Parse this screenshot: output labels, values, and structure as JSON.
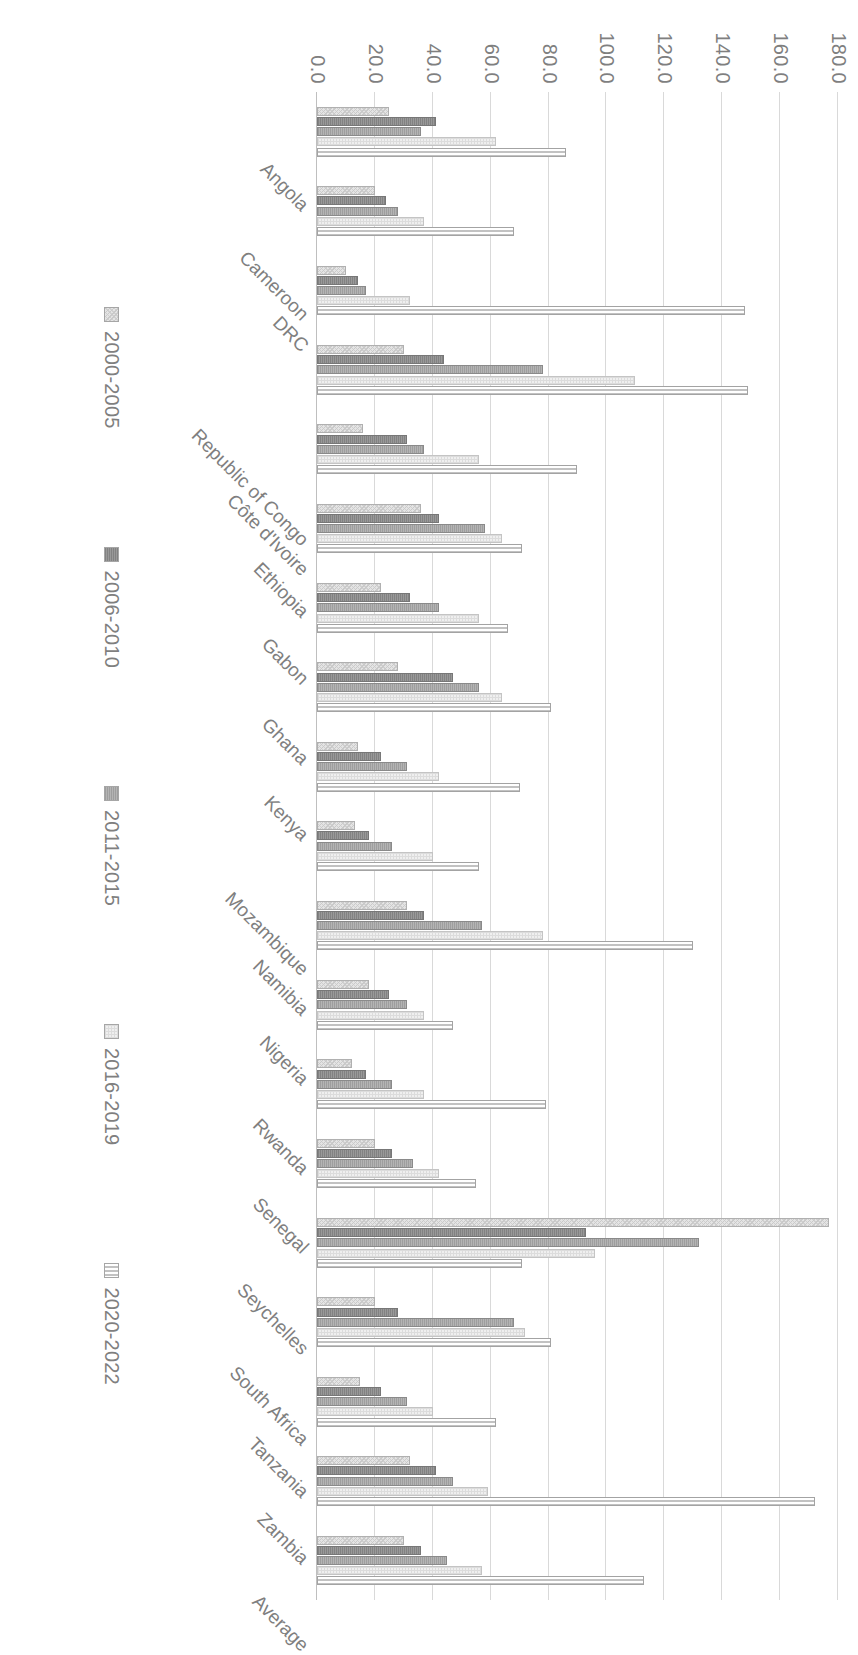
{
  "chart_data": {
    "type": "bar",
    "title": "",
    "subtitle": "",
    "xlabel": "",
    "ylabel": "",
    "orientation": "vertical-rotated-90",
    "grid": true,
    "legend_position": "bottom",
    "ylim": [
      0.0,
      180.0
    ],
    "ytick_labels": [
      "0.0",
      "20.0",
      "40.0",
      "60.0",
      "80.0",
      "100.0",
      "120.0",
      "140.0",
      "160.0",
      "180.0"
    ],
    "ytick_values": [
      0,
      20,
      40,
      60,
      80,
      100,
      120,
      140,
      160,
      180
    ],
    "categories": [
      "Angola",
      "Cameroon",
      "DRC",
      "Republic of Congo",
      "Côte d'Ivoire",
      "Ethiopia",
      "Gabon",
      "Ghana",
      "Kenya",
      "Mozambique",
      "Namibia",
      "Nigeria",
      "Rwanda",
      "Senegal",
      "Seychelles",
      "South Africa",
      "Tanzania",
      "Zambia",
      "Average"
    ],
    "series": [
      {
        "name": "2000-2005",
        "color": "#e4e4e4",
        "values": [
          25.0,
          20.0,
          10.0,
          30.0,
          16.0,
          36.0,
          22.0,
          28.0,
          14.0,
          13.0,
          31.0,
          18.0,
          12.0,
          20.0,
          177.0,
          20.0,
          15.0,
          32.0,
          30.0
        ]
      },
      {
        "name": "2006-2010",
        "color": "#8c8c8c",
        "values": [
          41.0,
          24.0,
          14.0,
          44.0,
          31.0,
          42.0,
          32.0,
          47.0,
          22.0,
          18.0,
          37.0,
          25.0,
          17.0,
          26.0,
          93.0,
          28.0,
          22.0,
          41.0,
          36.0
        ]
      },
      {
        "name": "2011-2015",
        "color": "#a8a8a8",
        "values": [
          36.0,
          28.0,
          17.0,
          78.0,
          37.0,
          58.0,
          42.0,
          56.0,
          31.0,
          26.0,
          57.0,
          31.0,
          26.0,
          33.0,
          132.0,
          68.0,
          31.0,
          47.0,
          45.0
        ]
      },
      {
        "name": "2016-2019",
        "color": "#efefef",
        "values": [
          62.0,
          37.0,
          32.0,
          110.0,
          56.0,
          64.0,
          56.0,
          64.0,
          42.0,
          40.0,
          78.0,
          37.0,
          37.0,
          42.0,
          96.0,
          72.0,
          40.0,
          59.0,
          57.0
        ]
      },
      {
        "name": "2020-2022",
        "color": "#e8e8e8",
        "values": [
          86.0,
          68.0,
          148.0,
          149.0,
          90.0,
          71.0,
          66.0,
          81.0,
          70.0,
          56.0,
          130.0,
          47.0,
          79.0,
          55.0,
          71.0,
          81.0,
          62.0,
          172.0,
          113.0
        ]
      }
    ]
  }
}
